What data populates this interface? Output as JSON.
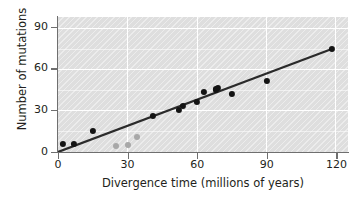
{
  "chart_data": {
    "type": "scatter",
    "title": "",
    "xlabel": "Divergence time (millions of years)",
    "ylabel": "Number of mutations",
    "xlim": [
      0,
      125
    ],
    "ylim": [
      0,
      97
    ],
    "xticks": [
      0,
      30,
      60,
      90,
      120
    ],
    "yticks": [
      0,
      30,
      60,
      90
    ],
    "xtick_labels": [
      "0",
      "30",
      "60",
      "90",
      "120"
    ],
    "ytick_labels": [
      "0",
      "30",
      "60",
      "90"
    ],
    "grid": "horizontal-and-vertical-white-gridlines",
    "minor_y_gridlines": [
      15,
      45,
      75
    ],
    "legend": "none",
    "plot_background": "#dedede",
    "hatch": "diagonal-stripes",
    "series": [
      {
        "name": "primary-data",
        "color": "#141414",
        "points": [
          {
            "x": 2,
            "y": 6
          },
          {
            "x": 7,
            "y": 6
          },
          {
            "x": 15,
            "y": 15
          },
          {
            "x": 41,
            "y": 26
          },
          {
            "x": 52,
            "y": 30
          },
          {
            "x": 54,
            "y": 33
          },
          {
            "x": 60,
            "y": 36
          },
          {
            "x": 63,
            "y": 43
          },
          {
            "x": 68,
            "y": 45
          },
          {
            "x": 69,
            "y": 46
          },
          {
            "x": 75,
            "y": 42
          },
          {
            "x": 90,
            "y": 51
          },
          {
            "x": 118,
            "y": 74
          }
        ]
      },
      {
        "name": "secondary-data",
        "color": "#a8a8a8",
        "points": [
          {
            "x": 25,
            "y": 4
          },
          {
            "x": 30,
            "y": 5
          },
          {
            "x": 34,
            "y": 11
          }
        ]
      }
    ],
    "trend_line": {
      "name": "regression-line",
      "color": "#2b2b2b",
      "x_start": 0,
      "y_start": 0,
      "x_end": 118,
      "y_end": 74,
      "slope": 0.627
    }
  }
}
